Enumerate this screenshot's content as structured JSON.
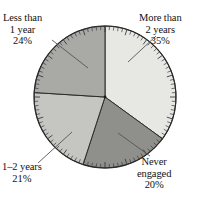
{
  "chart_data": {
    "type": "pie",
    "title": "",
    "xlabel": "",
    "ylabel": "",
    "grid": false,
    "legend_position": "callout-labels",
    "units": "percent",
    "start_angle_deg": 0,
    "direction": "clockwise",
    "categories": [
      "More than 2 years",
      "Never engaged",
      "1–2 years",
      "Less than 1 year"
    ],
    "values": [
      35,
      20,
      21,
      24
    ],
    "slices": [
      {
        "name": "more-than-2-years",
        "label_line1": "More than",
        "label_line2": "2 years",
        "value_text": "35%",
        "value": 35,
        "color": "#e7e7e4",
        "start_deg": 0,
        "end_deg": 126
      },
      {
        "name": "never-engaged",
        "label_line1": "Never",
        "label_line2": "engaged",
        "value_text": "20%",
        "value": 20,
        "color": "#8f8f8c",
        "start_deg": 126,
        "end_deg": 198
      },
      {
        "name": "1-2-years",
        "label_line1": "1–2 years",
        "label_line2": "",
        "value_text": "21%",
        "value": 21,
        "color": "#c5c5c2",
        "start_deg": 198,
        "end_deg": 273.6
      },
      {
        "name": "less-than-1-year",
        "label_line1": "Less than",
        "label_line2": "1 year",
        "value_text": "24%",
        "value": 24,
        "color": "#a9a9a6",
        "start_deg": 273.6,
        "end_deg": 360
      }
    ],
    "axis": {
      "type": "circular-percent-ticks",
      "tick_count": 100,
      "tick_color": "#3a3a3a"
    },
    "geometry": {
      "center_x": 105,
      "center_y": 97,
      "radius": 71
    },
    "colors": {
      "outline": "#2b2b2b",
      "leader_line": "#555555",
      "text": "#111111",
      "background": "#ffffff"
    }
  },
  "labels": {
    "top_left": {
      "line1": "Less than",
      "line2": "1 year",
      "pct": "24%"
    },
    "top_right": {
      "line1": "More than",
      "line2": "2 years",
      "pct": "35%"
    },
    "bottom_left": {
      "line1": "1–2 years",
      "pct": "21%"
    },
    "bottom_right": {
      "line1": "Never",
      "line2": "engaged",
      "pct": "20%"
    }
  }
}
